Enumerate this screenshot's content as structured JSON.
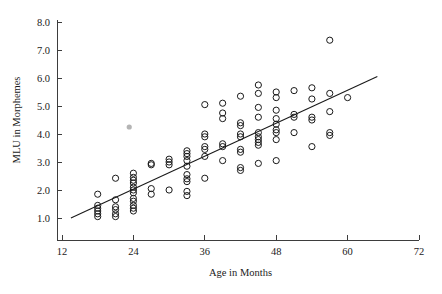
{
  "chart_data": {
    "type": "scatter",
    "title": "",
    "xlabel": "Age in Months",
    "ylabel": "MLU in Morphemes",
    "xlim": [
      12,
      72
    ],
    "ylim": [
      0.6,
      8.0
    ],
    "xticks": [
      12,
      24,
      36,
      48,
      60,
      72
    ],
    "xticklabels": [
      "12",
      "24",
      "36",
      "48",
      "60",
      "72"
    ],
    "yticks": [
      1.0,
      2.0,
      3.0,
      4.0,
      5.0,
      6.0,
      7.0,
      8.0
    ],
    "yticklabels": [
      "1.0",
      "2.0",
      "3.0",
      "4.0",
      "5.0",
      "6.0",
      "7.0",
      "8.0"
    ],
    "grid": false,
    "legend": null,
    "marker": "open-circle",
    "marker_color": "#1a1a1a",
    "background_color": "#ffffff",
    "axis_color": "#3d3d3d",
    "points": [
      [
        18,
        1.05
      ],
      [
        18,
        1.15
      ],
      [
        18,
        1.25
      ],
      [
        18,
        1.35
      ],
      [
        18,
        1.45
      ],
      [
        18,
        1.85
      ],
      [
        21,
        1.05
      ],
      [
        21,
        1.15
      ],
      [
        21,
        1.3
      ],
      [
        21,
        1.4
      ],
      [
        21,
        1.65
      ],
      [
        21,
        2.42
      ],
      [
        24,
        1.25
      ],
      [
        24,
        1.35
      ],
      [
        24,
        1.45
      ],
      [
        24,
        1.6
      ],
      [
        24,
        1.7
      ],
      [
        24,
        1.9
      ],
      [
        24,
        2.0
      ],
      [
        24,
        2.1
      ],
      [
        24,
        2.25
      ],
      [
        24,
        2.35
      ],
      [
        24,
        2.45
      ],
      [
        24,
        2.6
      ],
      [
        27,
        1.85
      ],
      [
        27,
        2.05
      ],
      [
        27,
        2.9
      ],
      [
        27,
        2.95
      ],
      [
        30,
        2.0
      ],
      [
        30,
        2.9
      ],
      [
        30,
        3.0
      ],
      [
        30,
        3.1
      ],
      [
        33,
        1.8
      ],
      [
        33,
        1.95
      ],
      [
        33,
        2.3
      ],
      [
        33,
        2.4
      ],
      [
        33,
        2.55
      ],
      [
        33,
        2.85
      ],
      [
        33,
        3.05
      ],
      [
        33,
        3.2
      ],
      [
        33,
        3.3
      ],
      [
        33,
        3.4
      ],
      [
        36,
        2.42
      ],
      [
        36,
        3.2
      ],
      [
        36,
        3.45
      ],
      [
        36,
        3.55
      ],
      [
        36,
        3.9
      ],
      [
        36,
        4.0
      ],
      [
        36,
        5.05
      ],
      [
        39,
        3.05
      ],
      [
        39,
        3.55
      ],
      [
        39,
        3.65
      ],
      [
        39,
        4.55
      ],
      [
        39,
        4.75
      ],
      [
        39,
        5.1
      ],
      [
        42,
        2.7
      ],
      [
        42,
        2.8
      ],
      [
        42,
        3.35
      ],
      [
        42,
        3.45
      ],
      [
        42,
        3.9
      ],
      [
        42,
        4.0
      ],
      [
        42,
        4.3
      ],
      [
        42,
        4.4
      ],
      [
        42,
        5.35
      ],
      [
        45,
        2.95
      ],
      [
        45,
        3.6
      ],
      [
        45,
        3.7
      ],
      [
        45,
        3.8
      ],
      [
        45,
        3.9
      ],
      [
        45,
        4.05
      ],
      [
        45,
        4.6
      ],
      [
        45,
        4.95
      ],
      [
        45,
        5.45
      ],
      [
        45,
        5.75
      ],
      [
        48,
        3.05
      ],
      [
        48,
        3.8
      ],
      [
        48,
        4.05
      ],
      [
        48,
        4.15
      ],
      [
        48,
        4.35
      ],
      [
        48,
        4.55
      ],
      [
        48,
        4.85
      ],
      [
        48,
        5.3
      ],
      [
        48,
        5.5
      ],
      [
        51,
        4.05
      ],
      [
        51,
        4.6
      ],
      [
        51,
        4.7
      ],
      [
        51,
        5.55
      ],
      [
        54,
        3.55
      ],
      [
        54,
        4.5
      ],
      [
        54,
        4.6
      ],
      [
        54,
        5.25
      ],
      [
        54,
        5.65
      ],
      [
        57,
        3.95
      ],
      [
        57,
        4.05
      ],
      [
        57,
        4.8
      ],
      [
        57,
        5.45
      ],
      [
        57,
        7.35
      ],
      [
        60,
        5.3
      ]
    ],
    "faint_points": [
      [
        23.3,
        4.25
      ]
    ],
    "fit_line": {
      "type": "linear-regression",
      "x_start": 13.5,
      "y_start": 1.0,
      "x_end": 65.0,
      "y_end": 6.05
    }
  }
}
